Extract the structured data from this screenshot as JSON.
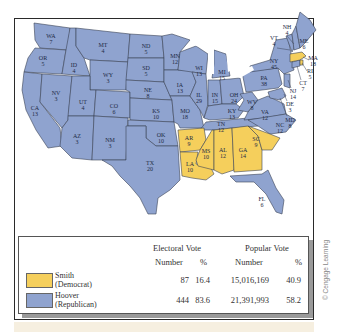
{
  "map": {
    "title": "Election of 1928",
    "colors": {
      "hoover": "#8fa3cf",
      "smith": "#f5cf5c",
      "border": "#3b4356",
      "water": "#ffffff"
    },
    "states": [
      {
        "abbr": "WA",
        "ev": "7",
        "party": "hoover"
      },
      {
        "abbr": "OR",
        "ev": "5",
        "party": "hoover"
      },
      {
        "abbr": "CA",
        "ev": "13",
        "party": "hoover"
      },
      {
        "abbr": "ID",
        "ev": "4",
        "party": "hoover"
      },
      {
        "abbr": "NV",
        "ev": "3",
        "party": "hoover"
      },
      {
        "abbr": "MT",
        "ev": "4",
        "party": "hoover"
      },
      {
        "abbr": "WY",
        "ev": "3",
        "party": "hoover"
      },
      {
        "abbr": "UT",
        "ev": "4",
        "party": "hoover"
      },
      {
        "abbr": "AZ",
        "ev": "3",
        "party": "hoover"
      },
      {
        "abbr": "CO",
        "ev": "6",
        "party": "hoover"
      },
      {
        "abbr": "NM",
        "ev": "3",
        "party": "hoover"
      },
      {
        "abbr": "ND",
        "ev": "5",
        "party": "hoover"
      },
      {
        "abbr": "SD",
        "ev": "5",
        "party": "hoover"
      },
      {
        "abbr": "NE",
        "ev": "8",
        "party": "hoover"
      },
      {
        "abbr": "KS",
        "ev": "10",
        "party": "hoover"
      },
      {
        "abbr": "OK",
        "ev": "10",
        "party": "hoover"
      },
      {
        "abbr": "TX",
        "ev": "20",
        "party": "hoover"
      },
      {
        "abbr": "MN",
        "ev": "12",
        "party": "hoover"
      },
      {
        "abbr": "IA",
        "ev": "13",
        "party": "hoover"
      },
      {
        "abbr": "MO",
        "ev": "18",
        "party": "hoover"
      },
      {
        "abbr": "AR",
        "ev": "9",
        "party": "smith"
      },
      {
        "abbr": "LA",
        "ev": "10",
        "party": "smith"
      },
      {
        "abbr": "WI",
        "ev": "13",
        "party": "hoover"
      },
      {
        "abbr": "IL",
        "ev": "29",
        "party": "hoover"
      },
      {
        "abbr": "MI",
        "ev": "15",
        "party": "hoover"
      },
      {
        "abbr": "IN",
        "ev": "15",
        "party": "hoover"
      },
      {
        "abbr": "OH",
        "ev": "24",
        "party": "hoover"
      },
      {
        "abbr": "KY",
        "ev": "13",
        "party": "hoover"
      },
      {
        "abbr": "TN",
        "ev": "12",
        "party": "hoover"
      },
      {
        "abbr": "MS",
        "ev": "10",
        "party": "smith"
      },
      {
        "abbr": "AL",
        "ev": "12",
        "party": "smith"
      },
      {
        "abbr": "GA",
        "ev": "14",
        "party": "smith"
      },
      {
        "abbr": "FL",
        "ev": "6",
        "party": "hoover"
      },
      {
        "abbr": "SC",
        "ev": "9",
        "party": "smith"
      },
      {
        "abbr": "NC",
        "ev": "12",
        "party": "hoover"
      },
      {
        "abbr": "VA",
        "ev": "12",
        "party": "hoover"
      },
      {
        "abbr": "WV",
        "ev": "8",
        "party": "hoover"
      },
      {
        "abbr": "PA",
        "ev": "38",
        "party": "hoover"
      },
      {
        "abbr": "NY",
        "ev": "45",
        "party": "hoover"
      },
      {
        "abbr": "VT",
        "ev": "4",
        "party": "hoover"
      },
      {
        "abbr": "NH",
        "ev": "4",
        "party": "hoover"
      },
      {
        "abbr": "ME",
        "ev": "6",
        "party": "hoover"
      },
      {
        "abbr": "MA",
        "ev": "18",
        "party": "smith"
      },
      {
        "abbr": "RI",
        "ev": "5",
        "party": "smith"
      },
      {
        "abbr": "CT",
        "ev": "7",
        "party": "hoover"
      },
      {
        "abbr": "NJ",
        "ev": "14",
        "party": "hoover"
      },
      {
        "abbr": "DE",
        "ev": "3",
        "party": "hoover"
      },
      {
        "abbr": "MD",
        "ev": "8",
        "party": "hoover"
      }
    ]
  },
  "legend": {
    "headers": {
      "electoral": "Electoral Vote",
      "popular": "Popular Vote"
    },
    "subheaders": {
      "ev_number": "Number",
      "ev_pct": "%",
      "pv_number": "Number",
      "pv_pct": "%"
    },
    "rows": [
      {
        "name": "Smith",
        "party": "(Democrat)",
        "color": "#f5cf5c",
        "ev_number": "87",
        "ev_pct": "16.4",
        "pv_number": "15,016,169",
        "pv_pct": "40.9"
      },
      {
        "name": "Hoover",
        "party": "(Republican)",
        "color": "#8fa3cf",
        "ev_number": "444",
        "ev_pct": "83.6",
        "pv_number": "21,391,993",
        "pv_pct": "58.2"
      }
    ]
  },
  "credit": "© Cengage Learning"
}
